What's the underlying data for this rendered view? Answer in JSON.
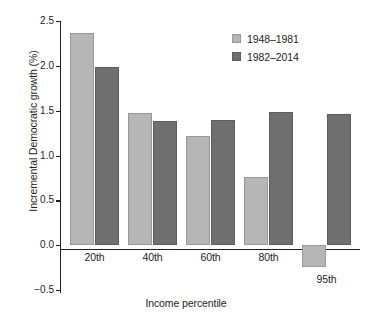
{
  "chart_data": {
    "type": "bar",
    "title": "",
    "xlabel": "Income percentile",
    "ylabel": "Incremental Democratic growth (%)",
    "categories": [
      "20th",
      "40th",
      "60th",
      "80th",
      "95th"
    ],
    "series": [
      {
        "name": "1948–1981",
        "color": "#b6b6b6",
        "values": [
          2.37,
          1.47,
          1.22,
          0.76,
          -0.24
        ]
      },
      {
        "name": "1982–2014",
        "color": "#6f6f6f",
        "values": [
          1.99,
          1.39,
          1.4,
          1.49,
          1.46
        ]
      }
    ],
    "ylim": [
      -0.5,
      2.5
    ],
    "yticks": [
      "2.5",
      "2.0",
      "1.5",
      "1.0",
      "0.5",
      "0.0",
      "−0.5"
    ],
    "ytick_values": [
      2.5,
      2.0,
      1.5,
      1.0,
      0.5,
      0.0,
      -0.5
    ],
    "grid": false,
    "legend_position": "top-right"
  },
  "legend": {
    "items": [
      {
        "label": "1948–1981",
        "swatch": "light-gray-swatch"
      },
      {
        "label": "1982–2014",
        "swatch": "dark-gray-swatch"
      }
    ]
  },
  "axes": {
    "y_title": "Incremental Democratic growth (%)",
    "x_title": "Income percentile"
  }
}
